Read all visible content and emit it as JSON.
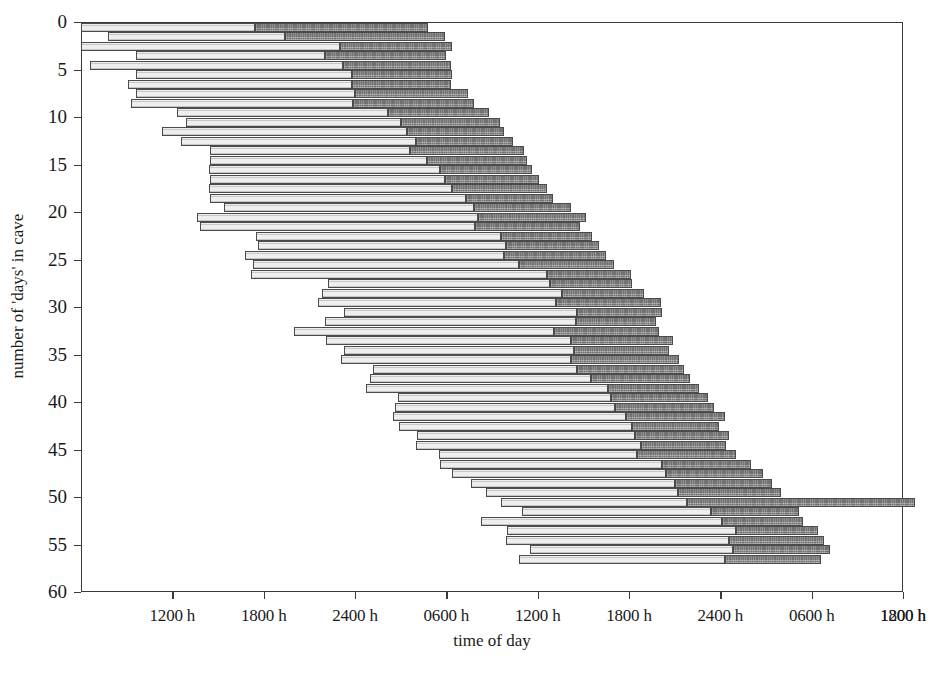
{
  "chart_data": {
    "type": "bar",
    "subtype": "actogram-horizontal-stacked",
    "title": "",
    "xlabel": "time of day",
    "ylabel": "number of 'days' in cave",
    "xlim": [
      6,
      60
    ],
    "ylim": [
      0,
      60
    ],
    "x_unit": "hours from start (clock time of day, double-plotted)",
    "y_unit": "day index",
    "grid": false,
    "legend": null,
    "xticks": [
      12,
      18,
      24,
      30,
      36,
      42,
      48,
      54,
      60
    ],
    "xtick_labels": [
      "1200 h",
      "1800 h",
      "2400 h",
      "0600 h",
      "1200 h",
      "1800 h",
      "2400 h",
      "0600 h",
      "1200 h",
      "1800 h"
    ],
    "xtick_values": [
      12,
      18,
      24,
      30,
      36,
      42,
      48,
      54,
      60,
      66
    ],
    "yticks": [
      0,
      5,
      10,
      15,
      20,
      25,
      30,
      35,
      40,
      45,
      50,
      55,
      60
    ],
    "ytick_labels": [
      "0",
      "5",
      "10",
      "15",
      "20",
      "25",
      "30",
      "35",
      "40",
      "45",
      "50",
      "55",
      "60"
    ],
    "series": [
      {
        "name": "wake",
        "color": "#eeeeee",
        "edge_color": "#4b4b4b"
      },
      {
        "name": "sleep",
        "color": "#8a8a8a",
        "edge_color": "#4b4b4b"
      }
    ],
    "bars": [
      {
        "day": 0,
        "wake_start": 6.0,
        "wake_end": 17.4,
        "sleep_start": 17.4,
        "sleep_end": 28.8
      },
      {
        "day": 1,
        "wake_start": 7.8,
        "wake_end": 19.4,
        "sleep_start": 19.4,
        "sleep_end": 29.9
      },
      {
        "day": 2,
        "wake_start": 6.0,
        "wake_end": 23.0,
        "sleep_start": 23.0,
        "sleep_end": 30.4
      },
      {
        "day": 3,
        "wake_start": 9.6,
        "wake_end": 22.0,
        "sleep_start": 22.0,
        "sleep_end": 30.0
      },
      {
        "day": 4,
        "wake_start": 6.6,
        "wake_end": 23.2,
        "sleep_start": 23.2,
        "sleep_end": 30.3
      },
      {
        "day": 5,
        "wake_start": 9.6,
        "wake_end": 23.8,
        "sleep_start": 23.8,
        "sleep_end": 30.4
      },
      {
        "day": 6,
        "wake_start": 9.1,
        "wake_end": 23.8,
        "sleep_start": 23.8,
        "sleep_end": 30.3
      },
      {
        "day": 7,
        "wake_start": 9.6,
        "wake_end": 24.0,
        "sleep_start": 24.0,
        "sleep_end": 31.4
      },
      {
        "day": 8,
        "wake_start": 9.3,
        "wake_end": 23.9,
        "sleep_start": 23.9,
        "sleep_end": 31.8
      },
      {
        "day": 9,
        "wake_start": 12.3,
        "wake_end": 26.2,
        "sleep_start": 26.2,
        "sleep_end": 32.8
      },
      {
        "day": 10,
        "wake_start": 12.9,
        "wake_end": 27.0,
        "sleep_start": 27.0,
        "sleep_end": 33.5
      },
      {
        "day": 11,
        "wake_start": 11.3,
        "wake_end": 27.4,
        "sleep_start": 27.4,
        "sleep_end": 33.8
      },
      {
        "day": 12,
        "wake_start": 12.6,
        "wake_end": 28.0,
        "sleep_start": 28.0,
        "sleep_end": 34.4
      },
      {
        "day": 13,
        "wake_start": 14.5,
        "wake_end": 27.6,
        "sleep_start": 27.6,
        "sleep_end": 35.1
      },
      {
        "day": 14,
        "wake_start": 14.5,
        "wake_end": 28.7,
        "sleep_start": 28.7,
        "sleep_end": 35.3
      },
      {
        "day": 15,
        "wake_start": 14.4,
        "wake_end": 29.6,
        "sleep_start": 29.6,
        "sleep_end": 35.6
      },
      {
        "day": 16,
        "wake_start": 14.5,
        "wake_end": 29.9,
        "sleep_start": 29.9,
        "sleep_end": 36.1
      },
      {
        "day": 17,
        "wake_start": 14.4,
        "wake_end": 30.4,
        "sleep_start": 30.4,
        "sleep_end": 36.6
      },
      {
        "day": 18,
        "wake_start": 14.5,
        "wake_end": 31.3,
        "sleep_start": 31.3,
        "sleep_end": 37.0
      },
      {
        "day": 19,
        "wake_start": 15.4,
        "wake_end": 31.8,
        "sleep_start": 31.8,
        "sleep_end": 38.2
      },
      {
        "day": 20,
        "wake_start": 13.6,
        "wake_end": 32.1,
        "sleep_start": 32.1,
        "sleep_end": 39.2
      },
      {
        "day": 21,
        "wake_start": 13.8,
        "wake_end": 31.9,
        "sleep_start": 31.9,
        "sleep_end": 38.8
      },
      {
        "day": 22,
        "wake_start": 17.5,
        "wake_end": 33.6,
        "sleep_start": 33.6,
        "sleep_end": 39.6
      },
      {
        "day": 23,
        "wake_start": 17.6,
        "wake_end": 33.9,
        "sleep_start": 33.9,
        "sleep_end": 40.0
      },
      {
        "day": 24,
        "wake_start": 16.8,
        "wake_end": 33.8,
        "sleep_start": 33.8,
        "sleep_end": 40.5
      },
      {
        "day": 25,
        "wake_start": 17.3,
        "wake_end": 34.8,
        "sleep_start": 34.8,
        "sleep_end": 41.0
      },
      {
        "day": 26,
        "wake_start": 17.2,
        "wake_end": 36.6,
        "sleep_start": 36.6,
        "sleep_end": 42.1
      },
      {
        "day": 27,
        "wake_start": 22.2,
        "wake_end": 36.8,
        "sleep_start": 36.8,
        "sleep_end": 42.2
      },
      {
        "day": 28,
        "wake_start": 21.8,
        "wake_end": 37.6,
        "sleep_start": 37.6,
        "sleep_end": 43.0
      },
      {
        "day": 29,
        "wake_start": 21.6,
        "wake_end": 37.2,
        "sleep_start": 37.2,
        "sleep_end": 44.1
      },
      {
        "day": 30,
        "wake_start": 23.3,
        "wake_end": 38.6,
        "sleep_start": 38.6,
        "sleep_end": 44.2
      },
      {
        "day": 31,
        "wake_start": 22.0,
        "wake_end": 38.5,
        "sleep_start": 38.5,
        "sleep_end": 43.8
      },
      {
        "day": 32,
        "wake_start": 20.0,
        "wake_end": 37.1,
        "sleep_start": 37.1,
        "sleep_end": 44.0
      },
      {
        "day": 33,
        "wake_start": 22.1,
        "wake_end": 38.2,
        "sleep_start": 38.2,
        "sleep_end": 44.9
      },
      {
        "day": 34,
        "wake_start": 23.3,
        "wake_end": 38.4,
        "sleep_start": 38.4,
        "sleep_end": 44.6
      },
      {
        "day": 35,
        "wake_start": 23.1,
        "wake_end": 38.2,
        "sleep_start": 38.2,
        "sleep_end": 45.3
      },
      {
        "day": 36,
        "wake_start": 25.2,
        "wake_end": 38.6,
        "sleep_start": 38.6,
        "sleep_end": 45.6
      },
      {
        "day": 37,
        "wake_start": 25.0,
        "wake_end": 39.5,
        "sleep_start": 39.5,
        "sleep_end": 46.0
      },
      {
        "day": 38,
        "wake_start": 24.7,
        "wake_end": 40.6,
        "sleep_start": 40.6,
        "sleep_end": 46.6
      },
      {
        "day": 39,
        "wake_start": 26.8,
        "wake_end": 40.8,
        "sleep_start": 40.8,
        "sleep_end": 47.2
      },
      {
        "day": 40,
        "wake_start": 26.6,
        "wake_end": 41.1,
        "sleep_start": 41.1,
        "sleep_end": 47.6
      },
      {
        "day": 41,
        "wake_start": 26.5,
        "wake_end": 41.8,
        "sleep_start": 41.8,
        "sleep_end": 48.3
      },
      {
        "day": 42,
        "wake_start": 26.9,
        "wake_end": 42.2,
        "sleep_start": 42.2,
        "sleep_end": 47.9
      },
      {
        "day": 43,
        "wake_start": 28.1,
        "wake_end": 42.4,
        "sleep_start": 42.4,
        "sleep_end": 48.6
      },
      {
        "day": 44,
        "wake_start": 28.0,
        "wake_end": 42.8,
        "sleep_start": 42.8,
        "sleep_end": 48.4
      },
      {
        "day": 45,
        "wake_start": 29.5,
        "wake_end": 42.5,
        "sleep_start": 42.5,
        "sleep_end": 49.0
      },
      {
        "day": 46,
        "wake_start": 29.6,
        "wake_end": 44.2,
        "sleep_start": 44.2,
        "sleep_end": 50.0
      },
      {
        "day": 47,
        "wake_start": 30.4,
        "wake_end": 44.4,
        "sleep_start": 44.4,
        "sleep_end": 50.8
      },
      {
        "day": 48,
        "wake_start": 31.6,
        "wake_end": 45.0,
        "sleep_start": 45.0,
        "sleep_end": 51.4
      },
      {
        "day": 49,
        "wake_start": 32.6,
        "wake_end": 45.2,
        "sleep_start": 45.2,
        "sleep_end": 52.0
      },
      {
        "day": 50,
        "wake_start": 33.6,
        "wake_end": 45.8,
        "sleep_start": 45.8,
        "sleep_end": 60.8
      },
      {
        "day": 51,
        "wake_start": 35.0,
        "wake_end": 47.4,
        "sleep_start": 47.4,
        "sleep_end": 53.2
      },
      {
        "day": 52,
        "wake_start": 32.3,
        "wake_end": 48.1,
        "sleep_start": 48.1,
        "sleep_end": 53.4
      },
      {
        "day": 53,
        "wake_start": 34.0,
        "wake_end": 49.0,
        "sleep_start": 49.0,
        "sleep_end": 54.4
      },
      {
        "day": 54,
        "wake_start": 33.9,
        "wake_end": 48.6,
        "sleep_start": 48.6,
        "sleep_end": 54.8
      },
      {
        "day": 55,
        "wake_start": 35.5,
        "wake_end": 48.8,
        "sleep_start": 48.8,
        "sleep_end": 55.2
      },
      {
        "day": 56,
        "wake_start": 34.8,
        "wake_end": 48.3,
        "sleep_start": 48.3,
        "sleep_end": 54.6
      }
    ]
  }
}
